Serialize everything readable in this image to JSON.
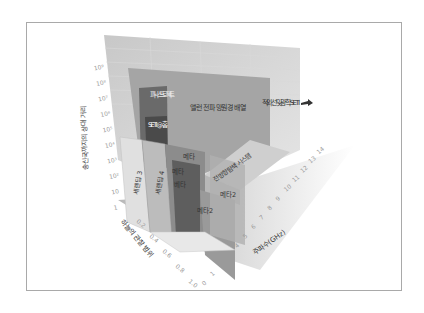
{
  "diagram": {
    "y_axis": {
      "label": "송신국까지의 상대 거리",
      "ticks": [
        "1",
        "10",
        "10²",
        "10³",
        "10⁴",
        "10⁵",
        "10⁶",
        "10⁷",
        "10⁸",
        "10⁹"
      ]
    },
    "x_axis": {
      "label": "하늘의 관찰 범위",
      "ticks": [
        "0.2",
        "0.4",
        "0.6",
        "0.8",
        "1.0"
      ]
    },
    "z_axis": {
      "label": "주파수(GHz)",
      "ticks": [
        "0",
        "1",
        "2",
        "3",
        "4",
        "5",
        "6",
        "7",
        "8",
        "9",
        "10",
        "11",
        "12",
        "13",
        "14"
      ]
    },
    "regions": {
      "phoenix": "피닉스 프로젝트",
      "seti_home": "SETI @ 홈",
      "allen": "앨런 전파 망원경 배열",
      "optical": "적외선 및 광학 SETI",
      "allsky": "전방향 탐색 시스템",
      "serendip3": "세렌딥 3",
      "serendip4": "세렌딥 4",
      "meta_a": "메타",
      "meta_b": "메타",
      "beta": "베타",
      "meta2_a": "메타2",
      "meta2_b": "메타2"
    }
  }
}
